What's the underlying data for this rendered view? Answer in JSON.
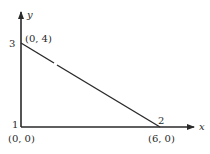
{
  "diagram": {
    "type": "coordinate-line-segment",
    "axes": {
      "x_label": "x",
      "y_label": "y"
    },
    "vertices": [
      {
        "id": 1,
        "number_label": "1",
        "coord_label": "(0, 0)",
        "x": 0,
        "y": 0
      },
      {
        "id": 2,
        "number_label": "2",
        "coord_label": "(6, 0)",
        "x": 6,
        "y": 0
      },
      {
        "id": 3,
        "number_label": "3",
        "coord_label": "(0, 4)",
        "x": 0,
        "y": 4
      }
    ],
    "segment": {
      "from": 3,
      "to": 2
    },
    "colors": {
      "ink": "#2a2a2a",
      "background": "#ffffff"
    }
  }
}
